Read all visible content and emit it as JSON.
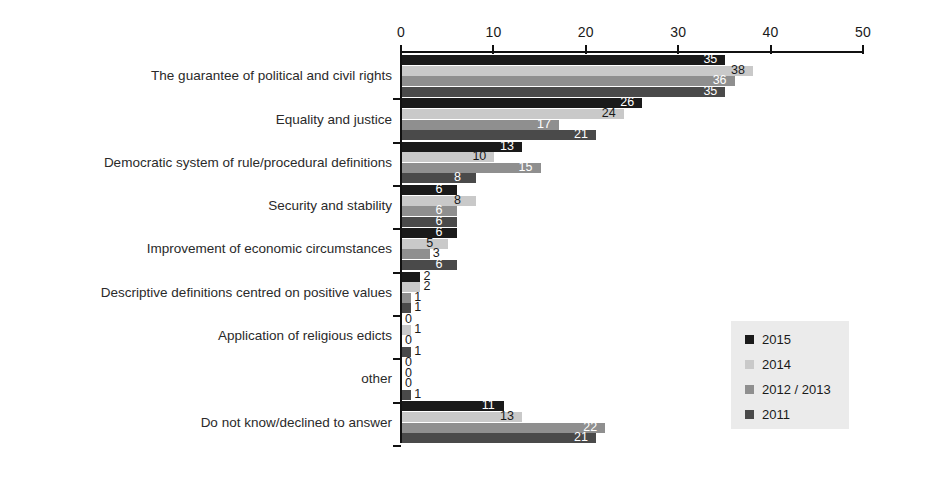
{
  "chart_data": {
    "type": "bar",
    "orientation": "horizontal",
    "title": "",
    "xlabel": "",
    "ylabel": "",
    "xlim": [
      0,
      50
    ],
    "xticks": [
      0,
      10,
      20,
      30,
      40,
      50
    ],
    "xtick_labels": [
      "0",
      "10",
      "20",
      "30",
      "40",
      "50"
    ],
    "grid": false,
    "legend_position": "center-right",
    "categories": [
      "The guarantee of political and civil rights",
      "Equality and justice",
      "Democratic system of rule/procedural definitions",
      "Security and stability",
      "Improvement of economic circumstances",
      "Descriptive definitions centred on positive values",
      "Application of religious edicts",
      "other",
      "Do not know/declined to answer"
    ],
    "series": [
      {
        "name": "2015",
        "color": "#1a1a1a",
        "values": [
          35,
          26,
          13,
          6,
          6,
          2,
          0,
          0,
          11
        ]
      },
      {
        "name": "2014",
        "color": "#c9c9c9",
        "values": [
          38,
          24,
          10,
          8,
          5,
          2,
          1,
          0,
          13
        ]
      },
      {
        "name": "2012 / 2013",
        "color": "#8f8f8f",
        "values": [
          36,
          17,
          15,
          6,
          3,
          1,
          0,
          0,
          22
        ]
      },
      {
        "name": "2011",
        "color": "#4a4a4a",
        "values": [
          35,
          21,
          8,
          6,
          6,
          1,
          1,
          1,
          21
        ]
      }
    ]
  },
  "legend": {
    "items": [
      {
        "label": "2015",
        "color": "#1a1a1a"
      },
      {
        "label": "2014",
        "color": "#c9c9c9"
      },
      {
        "label": "2012 / 2013",
        "color": "#8f8f8f"
      },
      {
        "label": "2011",
        "color": "#4a4a4a"
      }
    ]
  }
}
